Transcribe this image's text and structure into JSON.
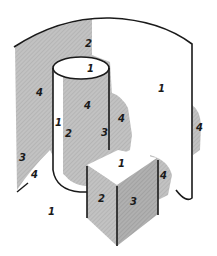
{
  "diagram": {
    "colors": {
      "background": "#ffffff",
      "light_shade": "#c9c9c9",
      "mid_shade": "#b4b4b4",
      "dark_shade": "#a2a2a2",
      "ink": "#1a1a1a"
    },
    "labels": [
      {
        "id": "wall-top-left",
        "text": "2",
        "x": 85,
        "y": 47
      },
      {
        "id": "cylinder-top",
        "text": "1",
        "x": 87,
        "y": 72
      },
      {
        "id": "wall-left-upper",
        "text": "4",
        "x": 36,
        "y": 96
      },
      {
        "id": "cylinder-body-center",
        "text": "4",
        "x": 84,
        "y": 109
      },
      {
        "id": "wall-right",
        "text": "1",
        "x": 158,
        "y": 92
      },
      {
        "id": "cylinder-shadow-right",
        "text": "4",
        "x": 118,
        "y": 122
      },
      {
        "id": "wall-right-edge",
        "text": "4",
        "x": 196,
        "y": 131
      },
      {
        "id": "cylinder-left-highlight",
        "text": "1",
        "x": 55,
        "y": 126
      },
      {
        "id": "cylinder-lower-mid",
        "text": "2",
        "x": 65,
        "y": 137
      },
      {
        "id": "cylinder-lower-right",
        "text": "3",
        "x": 101,
        "y": 136
      },
      {
        "id": "wall-left-lower",
        "text": "3",
        "x": 19,
        "y": 161
      },
      {
        "id": "wall-left-bottom",
        "text": "4",
        "x": 31,
        "y": 178
      },
      {
        "id": "floor",
        "text": "1",
        "x": 48,
        "y": 215
      },
      {
        "id": "cube-top",
        "text": "1",
        "x": 118,
        "y": 167
      },
      {
        "id": "cube-left-face",
        "text": "2",
        "x": 98,
        "y": 202
      },
      {
        "id": "cube-right-face",
        "text": "3",
        "x": 130,
        "y": 205
      },
      {
        "id": "cube-cast-shadow",
        "text": "4",
        "x": 160,
        "y": 179
      }
    ]
  }
}
